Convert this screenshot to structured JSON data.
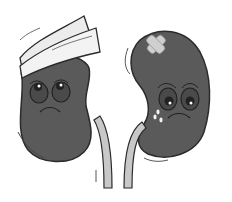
{
  "illustration": {
    "subject": "Two sad cartoon kidneys",
    "colors": {
      "kidney": "#5a5a5a",
      "outline": "#2b2b2b",
      "ureter": "#c8c8c8",
      "bandage": "#ececec",
      "plaster": "#cfcfcf",
      "background": "#ffffff"
    },
    "left_kidney": {
      "accessory": "head-bandage",
      "expression": "sad"
    },
    "right_kidney": {
      "accessory": "cross-plaster",
      "expression": "crying"
    }
  }
}
